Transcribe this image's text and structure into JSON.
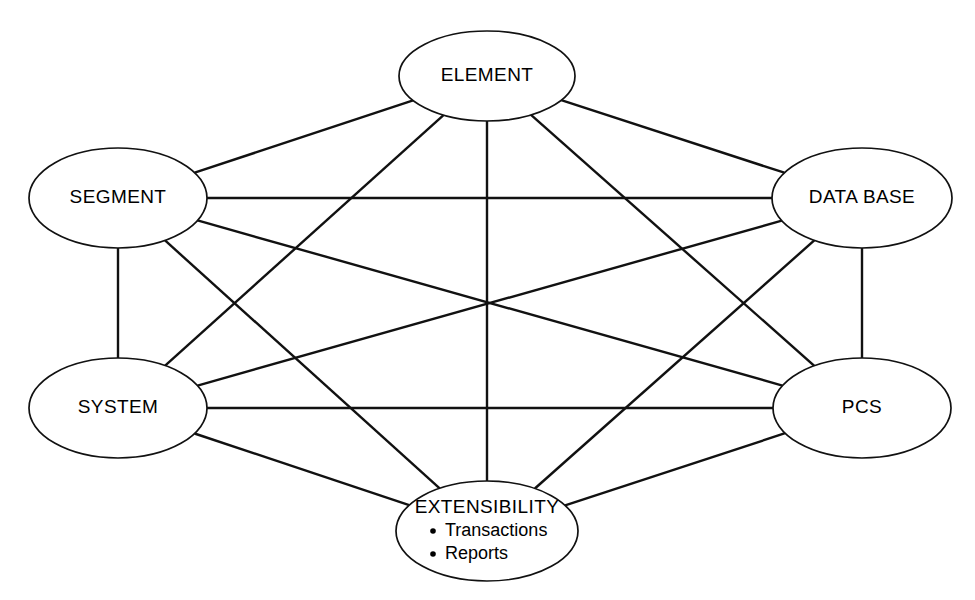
{
  "diagram": {
    "type": "complete-graph",
    "background_color": "#ffffff",
    "line_color": "#111111",
    "node_fill": "#ffffff",
    "node_stroke": "#111111"
  },
  "nodes": [
    {
      "id": "element",
      "label": "ELEMENT",
      "cx": 487,
      "cy": 76,
      "rx": 88,
      "ry": 45,
      "sublabels": []
    },
    {
      "id": "segment",
      "label": "SEGMENT",
      "cx": 118,
      "cy": 198,
      "rx": 89,
      "ry": 50,
      "sublabels": []
    },
    {
      "id": "database",
      "label": "DATA BASE",
      "cx": 862,
      "cy": 198,
      "rx": 90,
      "ry": 50,
      "sublabels": []
    },
    {
      "id": "system",
      "label": "SYSTEM",
      "cx": 118,
      "cy": 408,
      "rx": 89,
      "ry": 50,
      "sublabels": []
    },
    {
      "id": "pcs",
      "label": "PCS",
      "cx": 862,
      "cy": 408,
      "rx": 89,
      "ry": 50,
      "sublabels": []
    },
    {
      "id": "extensibility",
      "label": "EXTENSIBILITY",
      "cx": 487,
      "cy": 531,
      "rx": 91,
      "ry": 50,
      "sublabels": [
        "Transactions",
        "Reports"
      ]
    }
  ],
  "edges": [
    {
      "from": "element",
      "to": "segment"
    },
    {
      "from": "element",
      "to": "database"
    },
    {
      "from": "element",
      "to": "system"
    },
    {
      "from": "element",
      "to": "pcs"
    },
    {
      "from": "element",
      "to": "extensibility"
    },
    {
      "from": "segment",
      "to": "database"
    },
    {
      "from": "segment",
      "to": "system"
    },
    {
      "from": "segment",
      "to": "pcs"
    },
    {
      "from": "segment",
      "to": "extensibility"
    },
    {
      "from": "database",
      "to": "system"
    },
    {
      "from": "database",
      "to": "pcs"
    },
    {
      "from": "database",
      "to": "extensibility"
    },
    {
      "from": "system",
      "to": "pcs"
    },
    {
      "from": "system",
      "to": "extensibility"
    },
    {
      "from": "pcs",
      "to": "extensibility"
    }
  ]
}
